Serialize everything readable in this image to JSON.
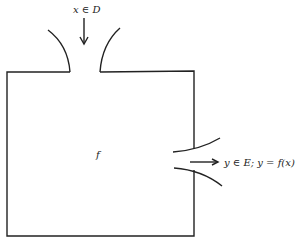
{
  "diagram": {
    "type": "function-box",
    "input_label": "x ∈ D",
    "function_label": "f",
    "output_label": "y ∈ E; y = f(x)",
    "colors": {
      "stroke": "#222222",
      "background": "#ffffff"
    }
  }
}
